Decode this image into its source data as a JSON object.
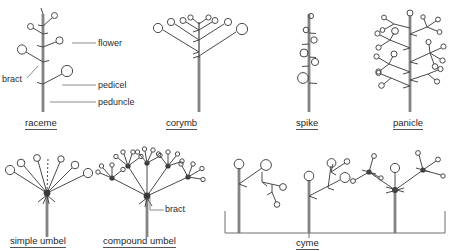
{
  "figure": {
    "stroke_color": "#4a4a4a",
    "stem_color": "#9a9a9a",
    "text_color": "#2b2b2b"
  },
  "annotations": {
    "flower": "flower",
    "pedicel": "pedicel",
    "peduncle": "peduncle",
    "bract": "bract",
    "bract_compound": "bract"
  },
  "types": [
    {
      "id": "raceme",
      "label": "raceme"
    },
    {
      "id": "corymb",
      "label": "corymb"
    },
    {
      "id": "spike",
      "label": "spike"
    },
    {
      "id": "panicle",
      "label": "panicle"
    },
    {
      "id": "simple-umbel",
      "label": "simple umbel"
    },
    {
      "id": "compound-umbel",
      "label": "compound umbel"
    },
    {
      "id": "cyme",
      "label": "cyme"
    }
  ]
}
